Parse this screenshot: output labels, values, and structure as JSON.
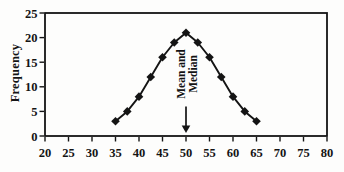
{
  "figure": {
    "background": "#fdfdfc",
    "ink_color": "#141414"
  },
  "chart_data": {
    "type": "line",
    "title": "",
    "xlabel": "",
    "ylabel": "Frequency",
    "x": [
      35,
      37.5,
      40,
      42.5,
      45,
      47.5,
      50,
      52.5,
      55,
      57.5,
      60,
      62.5,
      65
    ],
    "values": [
      3,
      5,
      8,
      12,
      16,
      19,
      21,
      19,
      16,
      12,
      8,
      5,
      3
    ],
    "series_name": "Frequency",
    "xlim": [
      20,
      80
    ],
    "ylim": [
      0,
      25
    ],
    "xticks": [
      20,
      25,
      30,
      35,
      40,
      45,
      50,
      55,
      60,
      65,
      70,
      75,
      80
    ],
    "yticks": [
      0,
      5,
      10,
      15,
      20,
      25
    ],
    "grid": false,
    "legend": "none",
    "marker": "diamond",
    "line_color": "#141414",
    "marker_color": "#141414",
    "plot_border": true,
    "annotation": {
      "lines": [
        "Mean and",
        "Median"
      ],
      "arrow_x": 50,
      "arrow_from_y": 6,
      "arrow_tip_y": 0.6
    }
  }
}
